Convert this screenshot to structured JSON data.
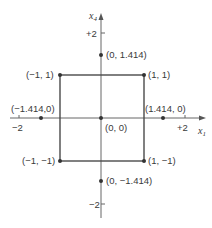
{
  "axes": {
    "x_label": "x",
    "x_sub": "1",
    "y_label": "x",
    "y_sub": "4",
    "x_ticks": [
      {
        "label": "−2",
        "value": -2
      },
      {
        "label": "+2",
        "value": 2
      }
    ],
    "y_ticks": [
      {
        "label": "+2",
        "value": 2
      },
      {
        "label": "−2",
        "value": -2
      }
    ]
  },
  "square": {
    "corners": [
      [
        -1,
        1
      ],
      [
        1,
        1
      ],
      [
        1,
        -1
      ],
      [
        -1,
        -1
      ]
    ]
  },
  "points": [
    {
      "label": "(0, 1.414)",
      "x": 0,
      "y": 1.414
    },
    {
      "label": "(−1, 1)",
      "x": -1,
      "y": 1
    },
    {
      "label": "(1, 1)",
      "x": 1,
      "y": 1
    },
    {
      "label": "(−1.414,0)",
      "x": -1.414,
      "y": 0
    },
    {
      "label": "(1.414, 0)",
      "x": 1.414,
      "y": 0
    },
    {
      "label": "(0, 0)",
      "x": 0,
      "y": 0
    },
    {
      "label": "(−1, −1)",
      "x": -1,
      "y": -1
    },
    {
      "label": "(1, −1)",
      "x": 1,
      "y": -1
    },
    {
      "label": "(0, −1.414)",
      "x": 0,
      "y": -1.414
    }
  ],
  "colors": {
    "line": "#555555",
    "box": "#4a4a4a",
    "dot": "#333333",
    "text": "#3a3a3a"
  }
}
